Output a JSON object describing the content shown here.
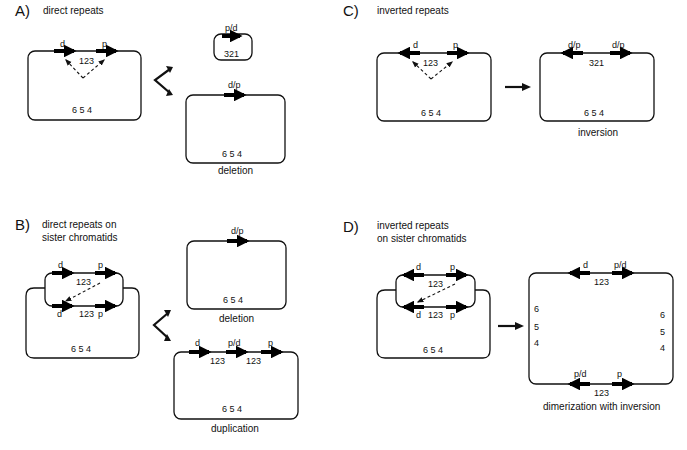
{
  "panels": {
    "A": {
      "letter": "A)",
      "title": "direct repeats",
      "source": {
        "repeat_left": "d",
        "repeat_right": "p",
        "segment": "123",
        "segment_bottom": "6 5 4"
      },
      "products": [
        {
          "repeat": "p/d",
          "segment": "321"
        },
        {
          "repeat": "d/p",
          "segment": "6 5 4",
          "caption": "deletion"
        }
      ]
    },
    "B": {
      "letter": "B)",
      "title_line1": "direct repeats on",
      "title_line2": "sister chromatids",
      "source": {
        "top_left": "d",
        "top_right": "p",
        "top_segment": "123",
        "bottom_left": "d",
        "bottom_segment": "123",
        "bottom_right": "p",
        "segment_bottom": "6 5 4"
      },
      "products": [
        {
          "repeat": "d/p",
          "segment": "6 5 4",
          "caption": "deletion"
        },
        {
          "repeat_1": "d",
          "repeat_2": "p/d",
          "repeat_3": "p",
          "segment_1": "123",
          "segment_2": "123",
          "segment_bottom": "6 5 4",
          "caption": "duplication"
        }
      ]
    },
    "C": {
      "letter": "C)",
      "title": "inverted repeats",
      "source": {
        "repeat_left": "d",
        "repeat_right": "p",
        "segment": "123",
        "segment_bottom": "6 5 4"
      },
      "product": {
        "repeat_left": "d/p",
        "repeat_right": "d/p",
        "segment": "321",
        "segment_bottom": "6 5 4",
        "caption": "inversion"
      }
    },
    "D": {
      "letter": "D)",
      "title_line1": "inverted repeats",
      "title_line2": "on sister chromatids",
      "source": {
        "top_left": "d",
        "top_right": "p",
        "top_segment": "123",
        "bottom_left": "d",
        "bottom_segment": "123",
        "bottom_right": "p",
        "segment_bottom": "6 5 4"
      },
      "product": {
        "top_left": "d",
        "top_right": "p/d",
        "top_segment": "123",
        "left_6": "6",
        "left_5": "5",
        "left_4": "4",
        "right_6": "6",
        "right_5": "5",
        "right_4": "4",
        "bottom_left": "p/d",
        "bottom_right": "p",
        "bottom_segment": "123",
        "caption": "dimerization with inversion"
      }
    }
  }
}
